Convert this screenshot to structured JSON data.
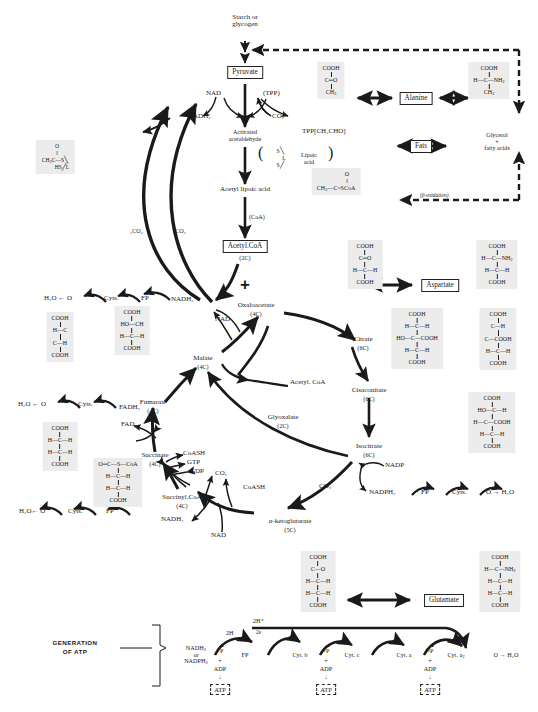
{
  "nodes": {
    "starch": "Starch or\nglycogen",
    "pyruvate": "Pyruvate",
    "nad_top": "NAD",
    "tpp": "(TPP)",
    "nadh2_top": "NADH₂",
    "co2_top": "CO₂",
    "activated_acetaldehyde": "Activated\nacetaldehyde",
    "tpp_ch3cho": "TPP[CH₃CHO]",
    "lipoic_acid": "Lipoic\nacid",
    "acetyl_lipoic": "Acetyl lipoic acid",
    "coa_step": "(CoA)",
    "acetyl_coa_box": "Acetyl.CoA",
    "acetyl_coa_c": "(2C)",
    "alanine": "Alanine",
    "fats": "Fats",
    "glycerol": "Glycerol\n+\nfatty acids",
    "beta_oxidation": "(β-oxidation)",
    "aspartate": "Aspartate",
    "glutamate": "Glutamate",
    "oxaloacetate": "Oxaloacetate",
    "oxaloacetate_c": "(4C)",
    "citrate": "Citrate",
    "citrate_c": "(6C)",
    "cisaconitate": "Cisaconitate",
    "cisaconitate_c": "(6C)",
    "isocitrate": "Isocitrate",
    "isocitrate_c": "(6C)",
    "alpha_kg": "α-ketoglutarate",
    "alpha_kg_c": "(5C)",
    "succinyl_coa": "Succinyl.CoA",
    "succinyl_coa_c": "(4C)",
    "succinate": "Succinate",
    "succinate_c": "(4C)",
    "fumarate": "Fumarate",
    "fumarate_c": "(4C)",
    "malate": "Malate",
    "malate_c": "(4C)",
    "acetyl_coa_side": "Acetyl. CoA",
    "glyoxalate": "Glyoxalate",
    "glyoxalate_c": "(2C)",
    "co2_left_a": "₂CO₂",
    "co2_left_b": "₂CO₂",
    "coash_1": "CoASH",
    "gtp": "GTP",
    "gdp": "GDP",
    "co2_succ": "CO₂",
    "coash_2": "CoASH",
    "co2_akg": "CO₂",
    "nadh2_succ": "NADH₂",
    "nad_succ": "NAD",
    "nadp": "NADP",
    "nadph2": "NADPH₂",
    "nad_mal": "NAD",
    "nadh2_mal": "NADH₂",
    "fad": "FAD",
    "fadh2": "FADH₂"
  },
  "chains": {
    "malate_chain": {
      "h2o": "H₂O ← O",
      "cyts": "Cyts.",
      "fp": "FP"
    },
    "fumarate_chain": {
      "h2o": "H₂O ← O",
      "cyts": "Cyts."
    },
    "succinate_chain": {
      "h2o": "H₂O← O",
      "cyts": "Cyts.",
      "fp": "FP"
    },
    "isocitrate_chain": {
      "fp": "FP",
      "cyts": "Cyts.",
      "o": "O → H₂O"
    }
  },
  "atp_section": {
    "label": "GENERATION\nOF  ATP",
    "start": "NADH₂\nor\nNADPH₂",
    "h2_label": "2H",
    "h_plus": "2H⁺",
    "two_e": "2e",
    "carriers": [
      "FP",
      "Cyt. b",
      "Cyt. c",
      "Cyt. a",
      "Cyt. a₂"
    ],
    "terminal": "O → H₂O",
    "coupling": {
      "p": "~P",
      "plus": "+",
      "adp": "ADP",
      "arrow": "↓",
      "atp": "ATP"
    },
    "coupling_count": 3
  },
  "structures": {
    "pyruvate": {
      "lines": [
        "COOH",
        "|",
        "C═O",
        "|",
        "CH₃"
      ]
    },
    "alanine": {
      "lines": [
        "COOH",
        "|",
        "H—C—NH₂",
        "|",
        "CH₃"
      ]
    },
    "acetyl_coa": {
      "lines": [
        "O",
        "‖",
        "CH₃—C~SCoA"
      ]
    },
    "act_acetald": {
      "lines": [
        "O",
        "‖",
        "CH₂C—S╲",
        "HS╱L"
      ]
    },
    "lipoic": {
      "lines": [
        "S╲",
        "L",
        "S╱"
      ]
    },
    "oxaloacetate": {
      "lines": [
        "COOH",
        "|",
        "C═O",
        "|",
        "H—C—H",
        "|",
        "COOH"
      ]
    },
    "aspartate": {
      "lines": [
        "COOH",
        "|",
        "H—C—NH₂",
        "|",
        "H—C—H",
        "|",
        "COOH"
      ]
    },
    "citrate": {
      "lines": [
        "COOH",
        "|",
        "H—C—H",
        "|",
        "HO—C—COOH",
        "|",
        "H—C—H",
        "|",
        "COOH"
      ]
    },
    "cisaconitate": {
      "lines": [
        "COOH",
        "|",
        "C—H",
        "‖",
        "C—COOH",
        "|",
        "H—C—H",
        "|",
        "COOH"
      ]
    },
    "isocitrate": {
      "lines": [
        "COOH",
        "|",
        "HO—C—H",
        "|",
        "H—C—COOH",
        "|",
        "H—C—H",
        "|",
        "COOH"
      ]
    },
    "alpha_kg": {
      "lines": [
        "COOH",
        "|",
        "C═O",
        "|",
        "H—C—H",
        "|",
        "H—C—H",
        "|",
        "COOH"
      ]
    },
    "glutamate": {
      "lines": [
        "COOH",
        "|",
        "H—C—NH₂",
        "|",
        "H—C—H",
        "|",
        "H—C—H",
        "|",
        "COOH"
      ]
    },
    "succinyl_coa": {
      "lines": [
        "O═C—S—CoA",
        "|",
        "H—C—H",
        "|",
        "H—C—H",
        "|",
        "COOH"
      ]
    },
    "succinate": {
      "lines": [
        "COOH",
        "|",
        "H—C—H",
        "|",
        "H—C—H",
        "|",
        "COOH"
      ]
    },
    "fumarate": {
      "lines": [
        "COOH",
        "|",
        "H—C",
        "‖",
        "C—H",
        "|",
        "COOH"
      ]
    },
    "malate": {
      "lines": [
        "COOH",
        "|",
        "HO—CH",
        "|",
        "H—C—H",
        "|",
        "COOH"
      ]
    }
  },
  "colors": {
    "ink": "#1a1a1a",
    "panel": "#ececec",
    "paper": "#ffffff"
  }
}
